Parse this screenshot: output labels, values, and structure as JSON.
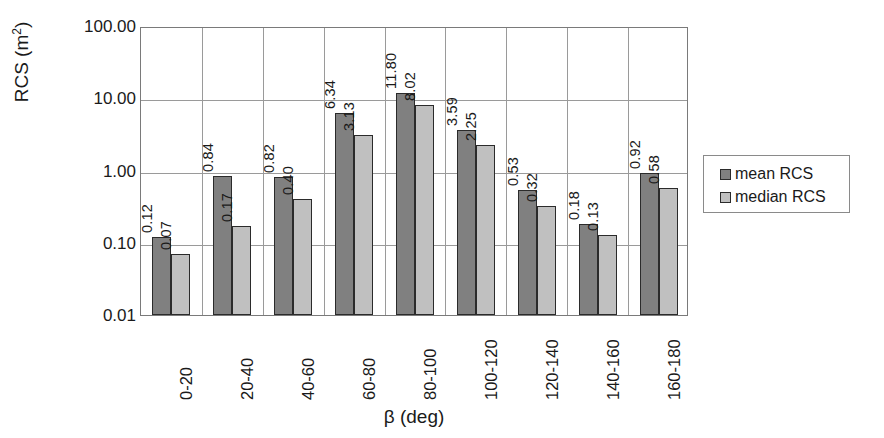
{
  "chart_data": {
    "type": "bar",
    "title": "",
    "xlabel": "β (deg)",
    "ylabel_prefix": "RCS (m",
    "ylabel_sup": "2",
    "ylabel_suffix": ")",
    "ylabel_full": "RCS (m2)",
    "yscale": "log",
    "ylim": [
      0.01,
      100.0
    ],
    "yticks": [
      100.0,
      10.0,
      1.0,
      0.1,
      0.01
    ],
    "ytick_labels": [
      "100.00",
      "10.00",
      "1.00",
      "0.10",
      "0.01"
    ],
    "grid": "horizontal-and-category-separators",
    "legend_position": "right",
    "categories": [
      "0-20",
      "20-40",
      "40-60",
      "60-80",
      "80-100",
      "100-120",
      "120-140",
      "140-160",
      "160-180"
    ],
    "series": [
      {
        "name": "mean RCS",
        "color": "#808080",
        "values": [
          0.12,
          0.84,
          0.82,
          6.34,
          11.8,
          3.59,
          0.53,
          0.18,
          0.92
        ],
        "labels": [
          "0.12",
          "0.84",
          "0.82",
          "6.34",
          "11.80",
          "3.59",
          "0.53",
          "0.18",
          "0.92"
        ]
      },
      {
        "name": "median RCS",
        "color": "#c0c0c0",
        "values": [
          0.07,
          0.17,
          0.4,
          3.13,
          8.02,
          2.25,
          0.32,
          0.13,
          0.58
        ],
        "labels": [
          "0.07",
          "0.17",
          "0.40",
          "3.13",
          "8.02",
          "2.25",
          "0.32",
          "0.13",
          "0.58"
        ]
      }
    ]
  },
  "legend": {
    "items": [
      {
        "label": "mean RCS",
        "color": "#808080"
      },
      {
        "label": "median RCS",
        "color": "#c0c0c0"
      }
    ]
  },
  "colors": {
    "mean": "#808080",
    "median": "#c0c0c0",
    "bar_edge": "#2b2b2b",
    "grid": "#9a9a9a",
    "axis": "#7a7a7a",
    "text": "#1a1a1a",
    "background": "#ffffff"
  }
}
